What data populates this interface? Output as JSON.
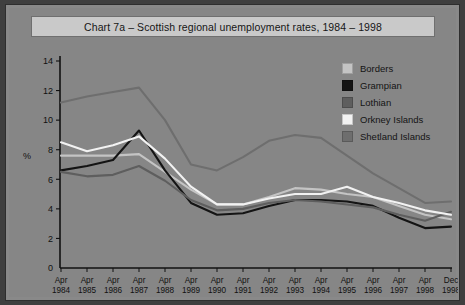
{
  "chart": {
    "title": "Chart 7a – Scottish regional unemployment rates, 1984 – 1998",
    "y_axis_label": "%",
    "background_color": "#868686",
    "panel_color": "#898989",
    "title_banner_color": "#c9c9c9",
    "frame_color": "#3f3f3f"
  },
  "legend": {
    "items": [
      {
        "label": "Borders",
        "color": "#c4c4c4"
      },
      {
        "label": "Grampian",
        "color": "#141414"
      },
      {
        "label": "Lothian",
        "color": "#5e5e5e"
      },
      {
        "label": "Orkney Islands",
        "color": "#f2f2f2"
      },
      {
        "label": "Shetland Islands",
        "color": "#6e6e6e"
      }
    ]
  },
  "chart_data": {
    "type": "line",
    "title": "Chart 7a – Scottish regional unemployment rates, 1984 – 1998",
    "xlabel": "",
    "ylabel": "%",
    "ylim": [
      0,
      14
    ],
    "yticks": [
      0,
      2,
      4,
      6,
      8,
      10,
      12,
      14
    ],
    "grid": false,
    "legend_position": "top-right",
    "categories": [
      "Apr 1984",
      "Apr 1985",
      "Apr 1986",
      "Apr 1987",
      "Apr 1988",
      "Apr 1989",
      "Apr 1990",
      "Apr 1991",
      "Apr 1992",
      "Apr 1993",
      "Apr 1994",
      "Apr 1995",
      "Apr 1996",
      "Apr 1997",
      "Apr 1998",
      "Dec 1998"
    ],
    "category_lines": [
      [
        "Apr",
        "1984"
      ],
      [
        "Apr",
        "1985"
      ],
      [
        "Apr",
        "1986"
      ],
      [
        "Apr",
        "1987"
      ],
      [
        "Apr",
        "1988"
      ],
      [
        "Apr",
        "1989"
      ],
      [
        "Apr",
        "1990"
      ],
      [
        "Apr",
        "1991"
      ],
      [
        "Apr",
        "1992"
      ],
      [
        "Apr",
        "1993"
      ],
      [
        "Apr",
        "1994"
      ],
      [
        "Apr",
        "1995"
      ],
      [
        "Apr",
        "1996"
      ],
      [
        "Apr",
        "1997"
      ],
      [
        "Apr",
        "1998"
      ],
      [
        "Dec",
        "1998"
      ]
    ],
    "series": [
      {
        "name": "Borders",
        "color": "#c4c4c4",
        "values": [
          7.6,
          7.6,
          7.6,
          7.7,
          6.5,
          5.3,
          4.3,
          4.3,
          4.8,
          5.4,
          5.3,
          5.0,
          4.8,
          4.2,
          3.6,
          3.3
        ]
      },
      {
        "name": "Grampian",
        "color": "#141414",
        "values": [
          6.6,
          6.9,
          7.3,
          9.3,
          6.6,
          4.4,
          3.6,
          3.7,
          4.2,
          4.6,
          4.6,
          4.5,
          4.2,
          3.4,
          2.7,
          2.8
        ]
      },
      {
        "name": "Lothian",
        "color": "#5e5e5e",
        "values": [
          6.5,
          6.2,
          6.3,
          6.9,
          5.9,
          4.6,
          3.9,
          4.0,
          4.4,
          4.6,
          4.5,
          4.3,
          4.1,
          3.6,
          3.2,
          3.8
        ]
      },
      {
        "name": "Orkney Islands",
        "color": "#f2f2f2",
        "values": [
          8.5,
          7.9,
          8.3,
          8.9,
          7.4,
          5.5,
          4.3,
          4.3,
          4.7,
          5.0,
          5.0,
          5.5,
          4.8,
          4.4,
          3.9,
          3.6
        ]
      },
      {
        "name": "Shetland Islands",
        "color": "#6e6e6e",
        "values": [
          11.2,
          11.6,
          11.9,
          12.2,
          10.0,
          7.0,
          6.6,
          7.5,
          8.6,
          9.0,
          8.8,
          7.6,
          6.4,
          5.4,
          4.4,
          4.5
        ]
      }
    ]
  }
}
